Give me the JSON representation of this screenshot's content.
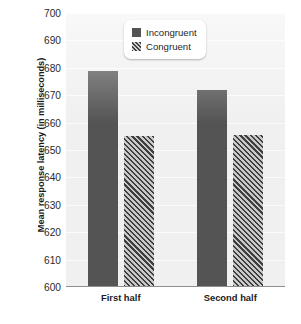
{
  "chart_data": {
    "type": "bar",
    "title": "",
    "xlabel": "",
    "ylabel": "Mean response latency (in milliseconds)",
    "categories": [
      "First half",
      "Second half"
    ],
    "series": [
      {
        "name": "Incongruent",
        "values": [
          679,
          672
        ],
        "style": "solid",
        "color": "#545454"
      },
      {
        "name": "Congruent",
        "values": [
          655,
          655.5
        ],
        "style": "hatched",
        "color": "#7e7e7e"
      }
    ],
    "ylim": [
      600,
      700
    ],
    "yticks": [
      700,
      690,
      680,
      670,
      660,
      650,
      640,
      630,
      620,
      610,
      600
    ],
    "ytick_labels": [
      "700",
      "690",
      "680",
      "670",
      "660",
      "650",
      "640",
      "630",
      "620",
      "610",
      "600"
    ],
    "grid": true,
    "legend_position": "top-center",
    "legend_entries": [
      "Incongruent",
      "Congruent"
    ],
    "plot_background": "#f0f0f0"
  }
}
